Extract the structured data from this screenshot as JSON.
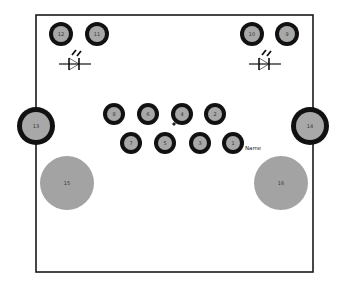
{
  "board": {
    "x": 36,
    "y": 15,
    "width": 277,
    "height": 257,
    "outline_color": "#1a1a1a",
    "fill": "#ffffff"
  },
  "colors": {
    "pad_ring": "#111111",
    "pad_fill": "#a8a8a8",
    "mount_fill": "#a3a3a3",
    "label": "#333333"
  },
  "pads": [
    {
      "id": "1",
      "label": "1",
      "cx": 233,
      "cy": 143,
      "r": 11,
      "ring": 4
    },
    {
      "id": "2",
      "label": "2",
      "cx": 215,
      "cy": 114,
      "r": 11,
      "ring": 4
    },
    {
      "id": "3",
      "label": "3",
      "cx": 200,
      "cy": 143,
      "r": 11,
      "ring": 4
    },
    {
      "id": "4",
      "label": "4",
      "cx": 182,
      "cy": 114,
      "r": 11,
      "ring": 4
    },
    {
      "id": "5",
      "label": "5",
      "cx": 165,
      "cy": 143,
      "r": 11,
      "ring": 4
    },
    {
      "id": "6",
      "label": "6",
      "cx": 148,
      "cy": 114,
      "r": 11,
      "ring": 4
    },
    {
      "id": "7",
      "label": "7",
      "cx": 131,
      "cy": 143,
      "r": 11,
      "ring": 4
    },
    {
      "id": "8",
      "label": "8",
      "cx": 114,
      "cy": 114,
      "r": 11,
      "ring": 4
    },
    {
      "id": "9",
      "label": "9",
      "cx": 287,
      "cy": 34,
      "r": 12,
      "ring": 4
    },
    {
      "id": "10",
      "label": "10",
      "cx": 252,
      "cy": 34,
      "r": 12,
      "ring": 4
    },
    {
      "id": "11",
      "label": "11",
      "cx": 97,
      "cy": 34,
      "r": 12,
      "ring": 4
    },
    {
      "id": "12",
      "label": "12",
      "cx": 61,
      "cy": 34,
      "r": 12,
      "ring": 4
    },
    {
      "id": "13",
      "label": "13",
      "cx": 36,
      "cy": 126,
      "r": 19,
      "ring": 5
    },
    {
      "id": "14",
      "label": "14",
      "cx": 310,
      "cy": 126,
      "r": 19,
      "ring": 5
    }
  ],
  "mounting_holes": [
    {
      "id": "15",
      "label": "15",
      "cx": 67,
      "cy": 183,
      "r": 27
    },
    {
      "id": "16",
      "label": "16",
      "cx": 281,
      "cy": 183,
      "r": 27
    }
  ],
  "leds": [
    {
      "id": "led-left",
      "cx": 75,
      "cy": 64
    },
    {
      "id": "led-right",
      "cx": 265,
      "cy": 64
    }
  ],
  "pin1_marker": {
    "x": 174,
    "y": 124
  },
  "name_label": {
    "text": "Name",
    "x": 245,
    "y": 150
  }
}
